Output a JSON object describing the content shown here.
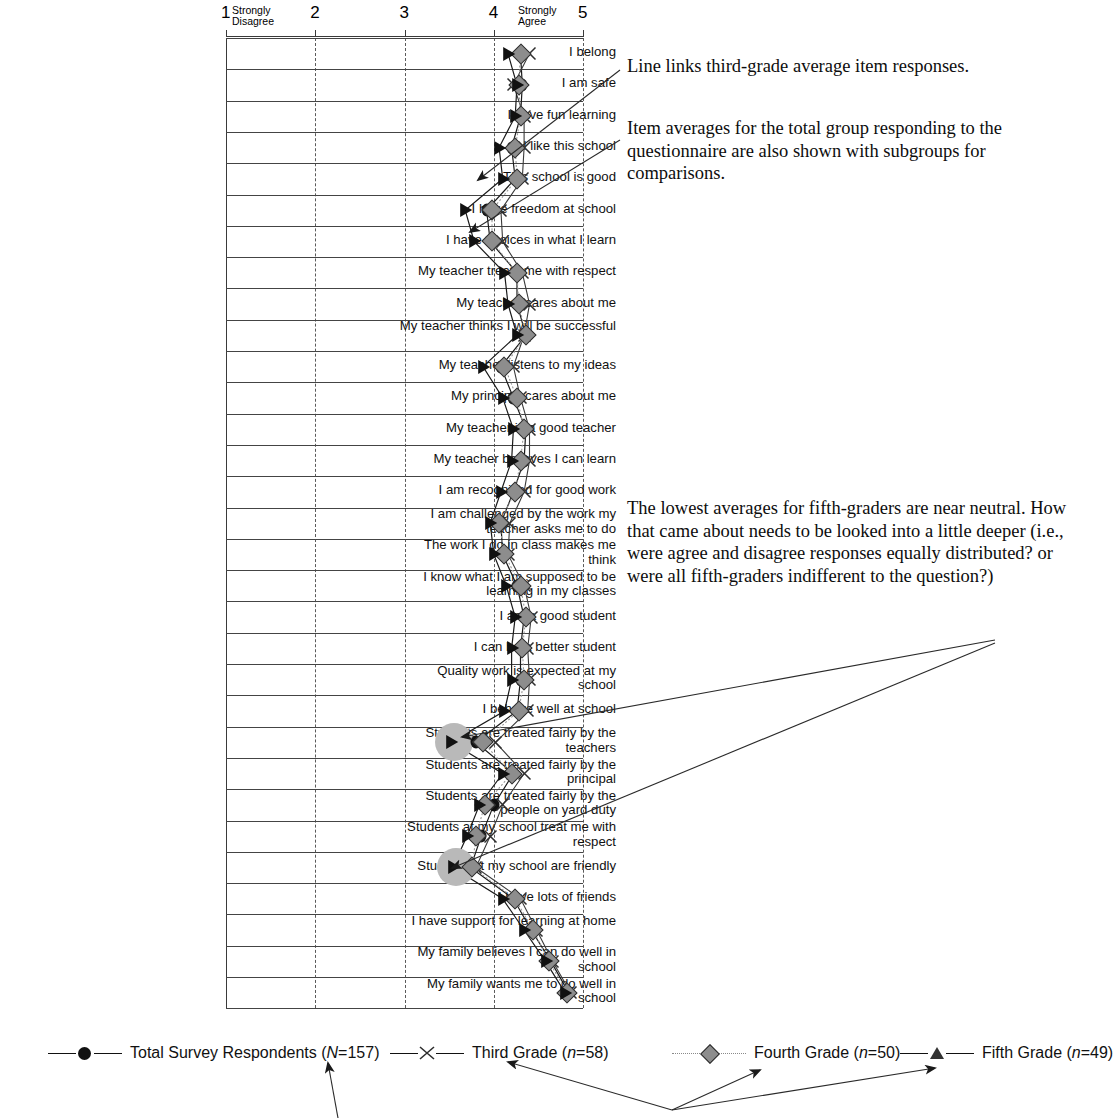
{
  "chart_data": {
    "type": "line",
    "title": "",
    "xlabel": "",
    "ylabel": "",
    "xlim": [
      1,
      5
    ],
    "xticks": [
      1,
      2,
      3,
      4,
      5
    ],
    "xtick_labels": [
      "1",
      "2",
      "3",
      "4",
      "5"
    ],
    "axis_anchor_low": "Strongly\nDisagree",
    "axis_anchor_low_line1": "Strongly",
    "axis_anchor_low_line2": "Disagree",
    "axis_anchor_high_line1": "Strongly",
    "axis_anchor_high_line2": "Agree",
    "grid": true,
    "orientation": "horizontal-items",
    "legend_position": "bottom",
    "categories": [
      "I belong",
      "I am safe",
      "I have fun learning",
      "I like this school",
      "This school is good",
      "I have freedom at school",
      "I have choices in what I learn",
      "My teacher treats me with respect",
      "My teacher cares about me",
      "My teacher thinks I will be successful",
      "My teacher listens to my ideas",
      "My principal cares about me",
      "My teacher is a good teacher",
      "My teacher believes I can learn",
      "I am recognized for good work",
      "I am challenged by the work my teacher asks me to do",
      "The work I do in class makes me think",
      "I know what I am supposed to be learning in my classes",
      "I am a good student",
      "I can be a better student",
      "Quality work is expected at my school",
      "I behave well at school",
      "Students are treated fairly by the teachers",
      "Students are treated fairly by the principal",
      "Students are treated fairly by the people on yard duty",
      "Students at my school treat me with respect",
      "Students at my school are friendly",
      "I have lots of friends",
      "I have support for learning at home",
      "My family believes I can do well in school",
      "My family wants me to do well in school"
    ],
    "series": [
      {
        "name": "Total Survey Respondents (N=157)",
        "marker": "filled-circle",
        "color": "#111111",
        "values": [
          4.3,
          4.32,
          4.3,
          4.2,
          4.24,
          3.92,
          3.96,
          4.26,
          4.26,
          4.36,
          4.08,
          4.22,
          4.36,
          4.34,
          4.22,
          4.08,
          4.1,
          4.26,
          4.34,
          4.3,
          4.3,
          4.26,
          3.8,
          4.22,
          4.0,
          3.86,
          3.74,
          4.22,
          4.42,
          4.64,
          4.84
        ]
      },
      {
        "name": "Third Grade (n=58)",
        "marker": "x-cross",
        "color": "#333333",
        "values": [
          4.4,
          4.22,
          4.34,
          4.34,
          4.32,
          4.08,
          4.1,
          4.32,
          4.4,
          4.34,
          4.22,
          4.3,
          4.4,
          4.4,
          4.34,
          4.18,
          4.16,
          4.34,
          4.42,
          4.38,
          4.4,
          4.38,
          4.02,
          4.34,
          4.1,
          3.96,
          3.8,
          4.3,
          4.48,
          4.66,
          4.86
        ]
      },
      {
        "name": "Fourth Grade (n=50)",
        "marker": "gray-diamond",
        "color": "#8d8d8d",
        "values": [
          4.3,
          4.28,
          4.3,
          4.24,
          4.26,
          3.98,
          3.98,
          4.26,
          4.28,
          4.36,
          4.12,
          4.26,
          4.34,
          4.3,
          4.24,
          4.06,
          4.12,
          4.3,
          4.36,
          4.32,
          4.34,
          4.28,
          3.88,
          4.2,
          3.9,
          3.8,
          3.76,
          4.24,
          4.44,
          4.62,
          4.82
        ]
      },
      {
        "name": "Fifth Grade (n=49)",
        "marker": "filled-triangle",
        "color": "#111111",
        "values": [
          4.16,
          4.26,
          4.24,
          4.06,
          4.1,
          3.68,
          3.78,
          4.12,
          4.16,
          4.26,
          3.88,
          4.1,
          4.22,
          4.2,
          4.08,
          3.96,
          4.0,
          4.14,
          4.24,
          4.2,
          4.2,
          4.12,
          3.52,
          4.1,
          3.84,
          3.7,
          3.54,
          4.1,
          4.34,
          4.58,
          4.8
        ]
      }
    ],
    "highlighted_points": [
      {
        "series": "Fifth Grade (n=49)",
        "category": "Students are treated fairly by the teachers",
        "value": 3.52
      },
      {
        "series": "Fifth Grade (n=49)",
        "category": "Students at my school are friendly",
        "value": 3.54
      }
    ]
  },
  "legend": {
    "entries": [
      {
        "label": "Total Survey Respondents (N=157)",
        "label_pre": "Total Survey Respondents (",
        "label_italic": "N",
        "label_post": "=157)",
        "marker": "filled-circle"
      },
      {
        "label": "Third Grade (n=58)",
        "label_pre": "Third Grade (",
        "label_italic": "n",
        "label_post": "=58)",
        "marker": "x-cross"
      },
      {
        "label": "Fourth Grade (n=50)",
        "label_pre": "Fourth Grade (",
        "label_italic": "n",
        "label_post": "=50)",
        "marker": "gray-diamond"
      },
      {
        "label": "Fifth Grade (n=49)",
        "label_pre": "Fifth Grade (",
        "label_italic": "n",
        "label_post": "=49)",
        "marker": "filled-triangle"
      }
    ]
  },
  "callouts": [
    {
      "id": "callout-line-link",
      "text": "Line links third-grade average item responses."
    },
    {
      "id": "callout-item-averages",
      "text": "Item averages for the total group responding to the questionnaire are also shown with subgroups for comparisons."
    },
    {
      "id": "callout-lowest-averages",
      "text": "The lowest averages for fifth-graders are near neutral. How that came about needs to be looked into a little deeper (i.e., were agree and disagree responses equally distributed? or were all fifth-graders indifferent to the question?)"
    }
  ],
  "bottom_note": {
    "text": "(cut off at page edge)"
  }
}
